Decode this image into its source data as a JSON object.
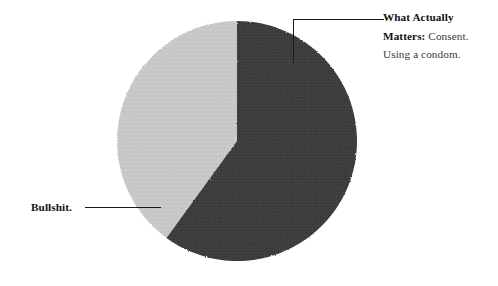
{
  "background_color": "#ffffff",
  "chart_data": {
    "type": "pie",
    "title": "",
    "labels": [
      "What Actually Matters",
      "Bullshit."
    ],
    "values": [
      60,
      40
    ],
    "categories": [
      "What Actually Matters",
      "Bullshit."
    ],
    "colors": [
      "#3d3d3d",
      "#c8c8c8"
    ],
    "start_angle_deg": 0,
    "direction": "clockwise",
    "legend": "none",
    "grid": false,
    "annotations": [
      {
        "target": "What Actually Matters",
        "position": "right",
        "bold_text": "What Actually Matters:",
        "plain_text": "Consent. Using a condom."
      },
      {
        "target": "Bullshit.",
        "position": "left",
        "bold_text": "Bullshit.",
        "plain_text": ""
      }
    ]
  },
  "slices": {
    "dark": {
      "name": "What Actually Matters",
      "color": "#3d3d3d",
      "percent": 60,
      "texture": "crosshatch"
    },
    "light": {
      "name": "Bullshit.",
      "color": "#c8c8c8",
      "percent": 40,
      "texture": "flat"
    }
  },
  "labels": {
    "right": {
      "line1_bold": "What Actually",
      "line2_bold": "Matters:",
      "line2_plain": " Consent.",
      "line3_plain": "Using a condom."
    },
    "left": {
      "text": "Bullshit."
    }
  }
}
